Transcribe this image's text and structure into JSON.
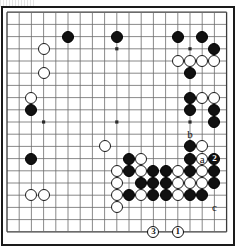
{
  "diagram": {
    "kind": "go-board-problem-diagram",
    "board_size": 19,
    "geometry": {
      "origin_x": 7.0,
      "origin_y": 12.2,
      "spacing": 12.2,
      "stone_radius": 6.0
    },
    "board_color": "#ffffff",
    "line_color": "#6b6b6b",
    "strong_line_color": "#3a3a3a",
    "border_color": "#1a1a1a",
    "black_color": "#111111",
    "white_color": "#ffffff"
  },
  "star_points": [
    {
      "col": 3,
      "row": 3
    },
    {
      "col": 9,
      "row": 3
    },
    {
      "col": 15,
      "row": 3
    },
    {
      "col": 3,
      "row": 9
    },
    {
      "col": 9,
      "row": 9
    },
    {
      "col": 15,
      "row": 9
    },
    {
      "col": 3,
      "row": 15
    },
    {
      "col": 9,
      "row": 15
    },
    {
      "col": 15,
      "row": 15
    }
  ],
  "black_stones": [
    {
      "col": 5,
      "row": 2
    },
    {
      "col": 14,
      "row": 2
    },
    {
      "col": 16,
      "row": 2
    },
    {
      "col": 17,
      "row": 3
    },
    {
      "col": 15,
      "row": 5
    },
    {
      "col": 15,
      "row": 7
    },
    {
      "col": 15,
      "row": 8
    },
    {
      "col": 17,
      "row": 8
    },
    {
      "col": 17,
      "row": 9
    },
    {
      "col": 2,
      "row": 8
    },
    {
      "col": 9,
      "row": 2
    },
    {
      "col": 2,
      "row": 12
    },
    {
      "col": 10,
      "row": 12
    },
    {
      "col": 15,
      "row": 11
    },
    {
      "col": 15,
      "row": 12
    },
    {
      "col": 10,
      "row": 13
    },
    {
      "col": 12,
      "row": 13
    },
    {
      "col": 13,
      "row": 13
    },
    {
      "col": 15,
      "row": 13
    },
    {
      "col": 17,
      "row": 13
    },
    {
      "col": 11,
      "row": 14
    },
    {
      "col": 12,
      "row": 14
    },
    {
      "col": 13,
      "row": 14
    },
    {
      "col": 17,
      "row": 14
    },
    {
      "col": 10,
      "row": 15
    },
    {
      "col": 12,
      "row": 15
    },
    {
      "col": 13,
      "row": 15
    },
    {
      "col": 15,
      "row": 15
    },
    {
      "col": 16,
      "row": 15
    }
  ],
  "white_stones": [
    {
      "col": 3,
      "row": 3
    },
    {
      "col": 3,
      "row": 5
    },
    {
      "col": 2,
      "row": 7
    },
    {
      "col": 14,
      "row": 4
    },
    {
      "col": 15,
      "row": 4
    },
    {
      "col": 16,
      "row": 4
    },
    {
      "col": 17,
      "row": 4
    },
    {
      "col": 16,
      "row": 7
    },
    {
      "col": 17,
      "row": 7
    },
    {
      "col": 2,
      "row": 15
    },
    {
      "col": 3,
      "row": 15
    },
    {
      "col": 8,
      "row": 11
    },
    {
      "col": 11,
      "row": 12
    },
    {
      "col": 16,
      "row": 11
    },
    {
      "col": 16,
      "row": 12
    },
    {
      "col": 9,
      "row": 13
    },
    {
      "col": 11,
      "row": 13
    },
    {
      "col": 14,
      "row": 13
    },
    {
      "col": 16,
      "row": 13
    },
    {
      "col": 9,
      "row": 14
    },
    {
      "col": 14,
      "row": 14
    },
    {
      "col": 15,
      "row": 14
    },
    {
      "col": 16,
      "row": 14
    },
    {
      "col": 9,
      "row": 15
    },
    {
      "col": 11,
      "row": 15
    },
    {
      "col": 14,
      "row": 15
    },
    {
      "col": 9,
      "row": 16
    }
  ],
  "numbered_moves": [
    {
      "label": "1",
      "color": "white",
      "col": 14,
      "row": 18
    },
    {
      "label": "2",
      "color": "black",
      "col": 17,
      "row": 12
    },
    {
      "label": "3",
      "color": "white",
      "col": 12,
      "row": 18
    }
  ],
  "letter_labels": [
    {
      "label": "a",
      "col": 16,
      "row": 12
    },
    {
      "label": "b",
      "col": 15,
      "row": 10
    },
    {
      "label": "c",
      "col": 17,
      "row": 16
    }
  ]
}
